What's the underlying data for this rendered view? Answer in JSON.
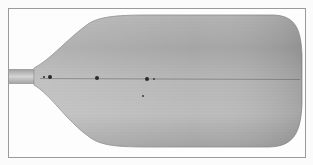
{
  "image": {
    "subject": "Wooden paddle blade",
    "style": "grayscale photograph",
    "colors": {
      "background": "#fbfbfb",
      "frame": "#9a9a9a",
      "wood_light": "#c9c9c9",
      "wood_mid": "#a9a9a9",
      "wood_dark": "#8a8a8a",
      "seam": "#555555",
      "holes": "#2a2a2a"
    },
    "features": [
      {
        "name": "shaft",
        "description": "Short cut-off shaft on left"
      },
      {
        "name": "blade",
        "description": "Wide flared blade with rounded tip on right"
      },
      {
        "name": "center-seam",
        "description": "Horizontal glue line along blade center"
      },
      {
        "name": "holes",
        "description": "Small dark dowel holes along centerline"
      }
    ]
  }
}
